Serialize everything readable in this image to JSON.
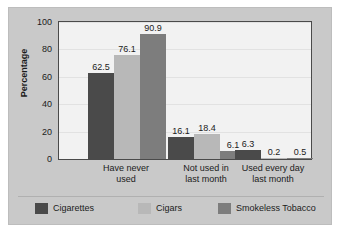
{
  "chart_data": {
    "type": "bar",
    "title": "",
    "subtitle": "",
    "xlabel": "",
    "ylabel": "Percentage",
    "ylim": [
      0,
      100
    ],
    "yticks": [
      100,
      80,
      60,
      40,
      20,
      0
    ],
    "grid": true,
    "legend_position": "bottom",
    "categories": [
      "Have never used",
      "Not used in last month",
      "Used every day last month"
    ],
    "category_lines": [
      [
        "Have never",
        "used"
      ],
      [
        "Not used in",
        "last month"
      ],
      [
        "Used every day",
        "last month"
      ]
    ],
    "series": [
      {
        "name": "Cigarettes",
        "color": "#4a4a4a",
        "values": [
          62.5,
          16.1,
          6.3
        ],
        "labels": [
          "62.5",
          "16.1",
          "6.3"
        ]
      },
      {
        "name": "Cigars",
        "color": "#b8b8b8",
        "values": [
          76.1,
          18.4,
          0.2
        ],
        "labels": [
          "76.1",
          "18.4",
          "0.2"
        ]
      },
      {
        "name": "Smokeless Tobacco",
        "color": "#7d7d7d",
        "values": [
          90.9,
          6.1,
          0.5
        ],
        "labels": [
          "90.9",
          "6.1",
          "0.5"
        ]
      }
    ]
  },
  "axis": {
    "y_title": "Percentage",
    "y_ticks": [
      "100",
      "80",
      "60",
      "40",
      "20",
      "0"
    ]
  },
  "legend": {
    "items": [
      {
        "label": "Cigarettes",
        "color": "#4a4a4a"
      },
      {
        "label": "Cigars",
        "color": "#b8b8b8"
      },
      {
        "label": "Smokeless Tobacco",
        "color": "#7d7d7d"
      }
    ]
  },
  "colors": {
    "panel_background": "#c9c9c9",
    "plot_background": "#f2f2f2",
    "plot_border": "#4a4a4a",
    "gridline": "#e2e2e2",
    "text": "#1b1b1b"
  }
}
